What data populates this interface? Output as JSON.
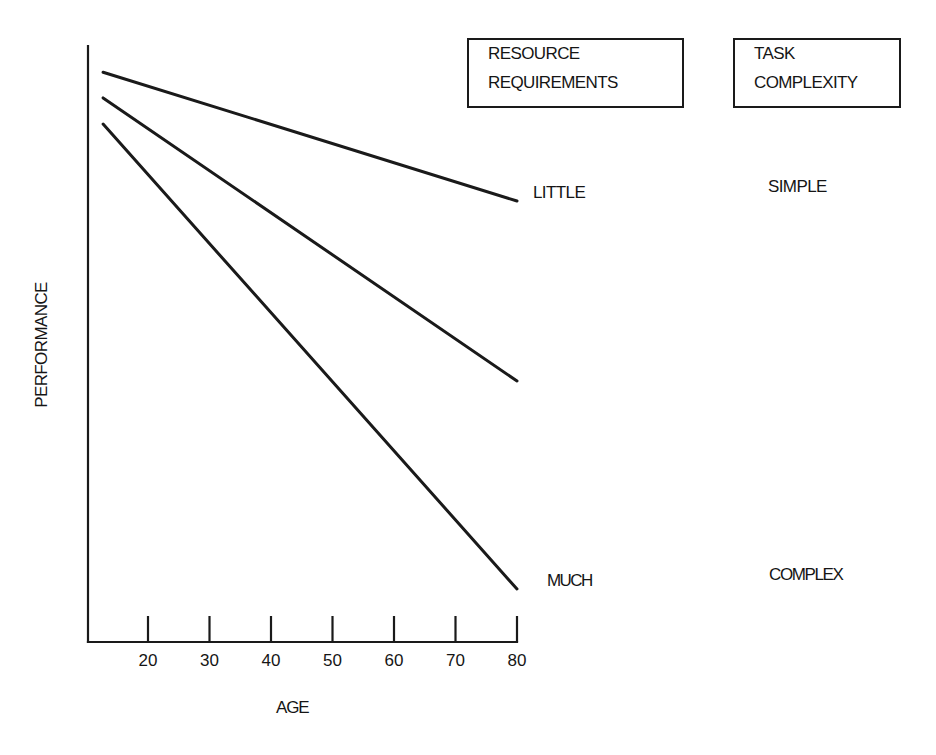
{
  "caption": {
    "text": "",
    "note": "top caption line cut off — only descenders visible"
  },
  "legend_headers": {
    "resource_requirements": [
      "RESOURCE",
      "REQUIREMENTS"
    ],
    "task_complexity": [
      "TASK",
      "COMPLEXITY"
    ]
  },
  "line_labels": {
    "resource_top": "LITTLE",
    "resource_bottom": "MUCH",
    "complexity_top": "SIMPLE",
    "complexity_bottom": "COMPLEX"
  },
  "axes": {
    "xlabel": "AGE",
    "ylabel": "PERFORMANCE",
    "x_ticks": [
      "20",
      "30",
      "40",
      "50",
      "60",
      "70",
      "80"
    ]
  },
  "colors": {
    "ink": "#1a1a1a",
    "background": "#ffffff"
  },
  "chart_data": {
    "type": "line",
    "title": "",
    "xlabel": "AGE",
    "ylabel": "PERFORMANCE",
    "x_ticks": [
      20,
      30,
      40,
      50,
      60,
      70,
      80
    ],
    "xlim": [
      10,
      80
    ],
    "ylim": [
      0,
      100
    ],
    "y_ticks": [],
    "grid": false,
    "y_scale_note": "y-axis unlabeled; values are relative performance estimated as % of axis height",
    "series": [
      {
        "name": "Little resource requirements / Simple task",
        "x": [
          12.7,
          80
        ],
        "values": [
          95.6,
          74.0
        ],
        "end_label": "LITTLE",
        "right_label": "SIMPLE"
      },
      {
        "name": "Intermediate",
        "x": [
          12.7,
          80
        ],
        "values": [
          91.3,
          43.8
        ],
        "end_label": "",
        "right_label": ""
      },
      {
        "name": "Much resource requirements / Complex task",
        "x": [
          12.7,
          80
        ],
        "values": [
          86.9,
          8.9
        ],
        "end_label": "MUCH",
        "right_label": "COMPLEX"
      }
    ],
    "legend": {
      "headers": [
        "RESOURCE REQUIREMENTS",
        "TASK COMPLEXITY"
      ],
      "position": "top-right",
      "entries": [
        {
          "resource": "LITTLE",
          "complexity": "SIMPLE"
        },
        {
          "resource": "MUCH",
          "complexity": "COMPLEX"
        }
      ]
    }
  }
}
